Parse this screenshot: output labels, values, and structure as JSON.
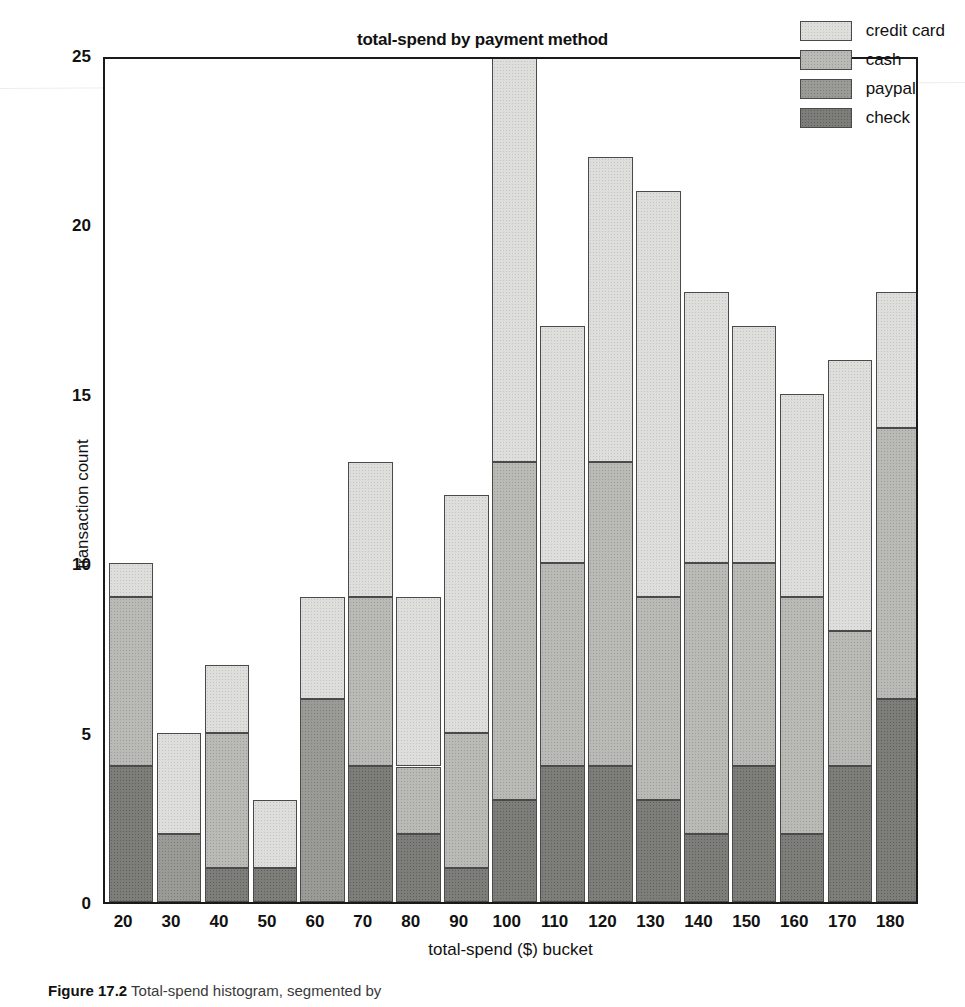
{
  "chart_data": {
    "type": "bar",
    "stacked": true,
    "title": "total-spend by payment method",
    "xlabel": "total-spend ($) bucket",
    "ylabel": "transaction count",
    "categories": [
      "20",
      "30",
      "40",
      "50",
      "60",
      "70",
      "80",
      "90",
      "100",
      "110",
      "120",
      "130",
      "140",
      "150",
      "160",
      "170",
      "180"
    ],
    "xticklabels": [
      "20",
      "30",
      "40",
      "50",
      "60",
      "70",
      "80",
      "90",
      "100",
      "110",
      "120",
      "130",
      "140",
      "150",
      "160",
      "170",
      "180"
    ],
    "yticks": [
      0,
      5,
      10,
      15,
      20,
      25
    ],
    "ylim": [
      0,
      25
    ],
    "grid": false,
    "legend_position": "upper right",
    "series": [
      {
        "name": "check",
        "color": "#7d7d7a",
        "values": [
          4,
          0,
          1,
          1,
          0,
          4,
          2,
          1,
          3,
          4,
          4,
          3,
          2,
          4,
          2,
          4,
          6
        ]
      },
      {
        "name": "paypal",
        "color": "#9a9a97",
        "values": [
          0,
          2,
          0,
          0,
          6,
          0,
          0,
          0,
          0,
          0,
          0,
          0,
          0,
          0,
          0,
          0,
          0
        ]
      },
      {
        "name": "cash",
        "color": "#b9b9b6",
        "values": [
          5,
          0,
          4,
          0,
          0,
          5,
          2,
          4,
          10,
          6,
          9,
          6,
          8,
          6,
          7,
          4,
          8
        ]
      },
      {
        "name": "credit card",
        "color": "#dededc",
        "values": [
          1,
          3,
          2,
          2,
          3,
          4,
          5,
          7,
          14,
          7,
          9,
          12,
          8,
          7,
          6,
          8,
          4
        ]
      }
    ],
    "totals": [
      10,
      5,
      7,
      3,
      9,
      13,
      9,
      12,
      27,
      17,
      22,
      21,
      18,
      17,
      15,
      16,
      18
    ],
    "legend": [
      {
        "label": "credit card",
        "color": "#dededc"
      },
      {
        "label": "cash",
        "color": "#b9b9b6"
      },
      {
        "label": "paypal",
        "color": "#9a9a97"
      },
      {
        "label": "check",
        "color": "#7d7d7a"
      }
    ]
  },
  "caption": {
    "figure_number": "Figure 17.2",
    "text": "Total-spend histogram, segmented by"
  }
}
